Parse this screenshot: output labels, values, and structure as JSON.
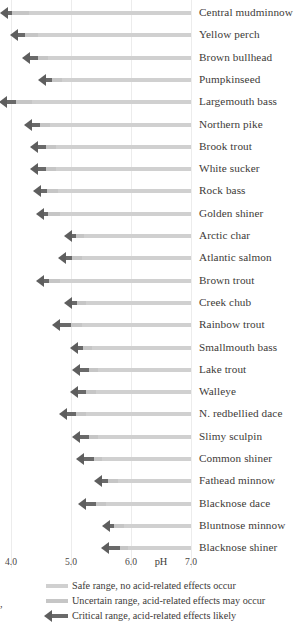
{
  "chart_data": {
    "type": "bar",
    "title": "",
    "xlabel": "pH",
    "ylabel": "",
    "xlim": [
      3.8,
      7.0
    ],
    "xticks": [
      4.0,
      5.0,
      6.0,
      7.0
    ],
    "xtick_labels": [
      "4.0",
      "5.0",
      "6.0",
      "7.0"
    ],
    "grid": true,
    "orientation": "horizontal",
    "legend_position": "bottom",
    "series": [
      {
        "name": "Safe range, no acid-related effects occur",
        "color": "#d0d0d0"
      },
      {
        "name": "Uncertain range, acid-related effects may occur",
        "color": "#c6c6c6"
      },
      {
        "name": "Critical range, acid-related effects likely",
        "color": "#6a6a6a"
      }
    ],
    "categories": [
      "Central mudminnow",
      "Yellow perch",
      "Brown bullhead",
      "Pumpkinseed",
      "Largemouth bass",
      "Northern pike",
      "Brook trout",
      "White sucker",
      "Rock bass",
      "Golden shiner",
      "Arctic char",
      "Atlantic salmon",
      "Brown trout",
      "Creek chub",
      "Rainbow trout",
      "Smallmouth bass",
      "Lake trout",
      "Walleye",
      "N. redbellied dace",
      "Slimy sculpin",
      "Common shiner",
      "Fathead minnow",
      "Blacknose dace",
      "Bluntnose minnow",
      "Blacknose shiner"
    ],
    "rows": [
      {
        "species": "Central mudminnow",
        "critical_start": 3.82,
        "critical_end": 4.02,
        "uncertain_end": 4.3,
        "safe_end": 7.0
      },
      {
        "species": "Yellow perch",
        "critical_start": 3.98,
        "critical_end": 4.24,
        "uncertain_end": 4.45,
        "safe_end": 7.0
      },
      {
        "species": "Brown bullhead",
        "critical_start": 4.18,
        "critical_end": 4.45,
        "uncertain_end": 4.62,
        "safe_end": 7.0
      },
      {
        "species": "Pumpkinseed",
        "critical_start": 4.45,
        "critical_end": 4.68,
        "uncertain_end": 4.85,
        "safe_end": 7.0
      },
      {
        "species": "Largemouth bass",
        "critical_start": 3.8,
        "critical_end": 4.08,
        "uncertain_end": 4.35,
        "safe_end": 7.0
      },
      {
        "species": "Northern pike",
        "critical_start": 4.22,
        "critical_end": 4.48,
        "uncertain_end": 4.65,
        "safe_end": 7.0
      },
      {
        "species": "Brook trout",
        "critical_start": 4.32,
        "critical_end": 4.58,
        "uncertain_end": 4.75,
        "safe_end": 7.0
      },
      {
        "species": "White sucker",
        "critical_start": 4.32,
        "critical_end": 4.58,
        "uncertain_end": 4.75,
        "safe_end": 7.0
      },
      {
        "species": "Rock bass",
        "critical_start": 4.36,
        "critical_end": 4.6,
        "uncertain_end": 4.78,
        "safe_end": 7.0
      },
      {
        "species": "Golden shiner",
        "critical_start": 4.42,
        "critical_end": 4.62,
        "uncertain_end": 4.82,
        "safe_end": 7.0
      },
      {
        "species": "Arctic char",
        "critical_start": 4.88,
        "critical_end": 5.08,
        "uncertain_end": 5.22,
        "safe_end": 7.0
      },
      {
        "species": "Atlantic salmon",
        "critical_start": 4.78,
        "critical_end": 5.02,
        "uncertain_end": 5.18,
        "safe_end": 7.0
      },
      {
        "species": "Brown trout",
        "critical_start": 4.42,
        "critical_end": 4.64,
        "uncertain_end": 4.82,
        "safe_end": 7.0
      },
      {
        "species": "Creek chub",
        "critical_start": 4.88,
        "critical_end": 5.1,
        "uncertain_end": 5.25,
        "safe_end": 7.0
      },
      {
        "species": "Rainbow trout",
        "critical_start": 4.68,
        "critical_end": 5.0,
        "uncertain_end": 5.18,
        "safe_end": 7.0
      },
      {
        "species": "Smallmouth bass",
        "critical_start": 4.98,
        "critical_end": 5.2,
        "uncertain_end": 5.35,
        "safe_end": 7.0
      },
      {
        "species": "Lake trout",
        "critical_start": 5.02,
        "critical_end": 5.3,
        "uncertain_end": 5.45,
        "safe_end": 7.0
      },
      {
        "species": "Walleye",
        "critical_start": 4.98,
        "critical_end": 5.25,
        "uncertain_end": 5.42,
        "safe_end": 7.0
      },
      {
        "species": "N. redbellied dace",
        "critical_start": 4.8,
        "critical_end": 5.08,
        "uncertain_end": 5.25,
        "safe_end": 7.0
      },
      {
        "species": "Slimy sculpin",
        "critical_start": 5.02,
        "critical_end": 5.3,
        "uncertain_end": 5.45,
        "safe_end": 7.0
      },
      {
        "species": "Common shiner",
        "critical_start": 5.08,
        "critical_end": 5.38,
        "uncertain_end": 5.52,
        "safe_end": 7.0
      },
      {
        "species": "Fathead minnow",
        "critical_start": 5.38,
        "critical_end": 5.62,
        "uncertain_end": 5.78,
        "safe_end": 7.0
      },
      {
        "species": "Blacknose dace",
        "critical_start": 5.12,
        "critical_end": 5.42,
        "uncertain_end": 5.58,
        "safe_end": 7.0
      },
      {
        "species": "Bluntnose minnow",
        "critical_start": 5.52,
        "critical_end": 5.72,
        "uncertain_end": 5.88,
        "safe_end": 7.0
      },
      {
        "species": "Blacknose shiner",
        "critical_start": 5.5,
        "critical_end": 5.82,
        "uncertain_end": 5.95,
        "safe_end": 7.0
      }
    ]
  },
  "axis": {
    "ticks": [
      {
        "label": "4.0",
        "value": 4.0
      },
      {
        "label": "5.0",
        "value": 5.0
      },
      {
        "label": "6.0",
        "value": 6.0
      },
      {
        "label": "7.0",
        "value": 7.0
      }
    ],
    "title": "pH"
  },
  "legend": {
    "items": [
      {
        "label": "Safe range, no acid-related effects occur",
        "kind": "safe"
      },
      {
        "label": "Uncertain range, acid-related effects may occur",
        "kind": "uncertain"
      },
      {
        "label": "Critical range, acid-related effects likely",
        "kind": "critical"
      }
    ]
  },
  "margin_note": ","
}
